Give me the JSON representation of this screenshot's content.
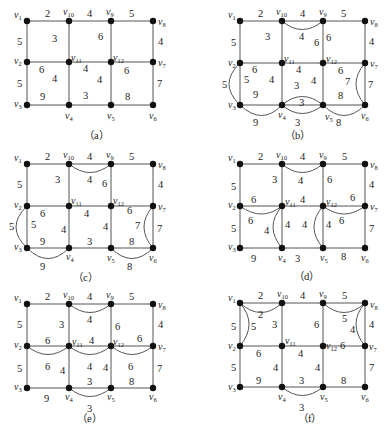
{
  "figure": {
    "vertices": [
      "v1",
      "v2",
      "v3",
      "v4",
      "v5",
      "v6",
      "v7",
      "v8",
      "v9",
      "v10",
      "v11",
      "v12"
    ],
    "grid_layout": {
      "top_row": [
        "v1",
        "v10",
        "v9",
        "v8"
      ],
      "middle_row": [
        "v2",
        "v11",
        "v12",
        "v7"
      ],
      "bottom_row": [
        "v3",
        "v4",
        "v5",
        "v6"
      ]
    },
    "base_edges": [
      {
        "u": "v1",
        "v": "v10",
        "w": 2
      },
      {
        "u": "v10",
        "v": "v9",
        "w": 4
      },
      {
        "u": "v9",
        "v": "v8",
        "w": 5
      },
      {
        "u": "v1",
        "v": "v2",
        "w": 5
      },
      {
        "u": "v10",
        "v": "v11",
        "w": 3
      },
      {
        "u": "v9",
        "v": "v12",
        "w": 6
      },
      {
        "u": "v8",
        "v": "v7",
        "w": 4
      },
      {
        "u": "v2",
        "v": "v11",
        "w": 6
      },
      {
        "u": "v11",
        "v": "v12",
        "w": 4
      },
      {
        "u": "v12",
        "v": "v7",
        "w": 6
      },
      {
        "u": "v2",
        "v": "v3",
        "w": 5
      },
      {
        "u": "v11",
        "v": "v4",
        "w": 4
      },
      {
        "u": "v12",
        "v": "v5",
        "w": 4
      },
      {
        "u": "v7",
        "v": "v6",
        "w": 7
      },
      {
        "u": "v3",
        "v": "v4",
        "w": 9
      },
      {
        "u": "v4",
        "v": "v5",
        "w": 3
      },
      {
        "u": "v5",
        "v": "v6",
        "w": 8
      }
    ],
    "panels": [
      {
        "id": "a",
        "caption": "（a）",
        "added_edges": []
      },
      {
        "id": "b",
        "caption": "（b）",
        "added_edges": [
          {
            "u": "v10",
            "v": "v9",
            "w": 4
          },
          {
            "u": "v9",
            "v": "v12",
            "w": 6
          },
          {
            "u": "v2",
            "v": "v3",
            "w": 5
          },
          {
            "u": "v3",
            "v": "v4",
            "w": 9
          },
          {
            "u": "v4",
            "v": "v5",
            "w": 3
          },
          {
            "u": "v4",
            "v": "v5",
            "w": 3,
            "note": "second duplicate above"
          },
          {
            "u": "v5",
            "v": "v6",
            "w": 8
          },
          {
            "u": "v7",
            "v": "v6",
            "w": 7
          }
        ]
      },
      {
        "id": "c",
        "caption": "（c）",
        "added_edges": [
          {
            "u": "v10",
            "v": "v9",
            "w": 4
          },
          {
            "u": "v2",
            "v": "v3",
            "w": 5
          },
          {
            "u": "v3",
            "v": "v4",
            "w": 9
          },
          {
            "u": "v5",
            "v": "v6",
            "w": 8
          },
          {
            "u": "v7",
            "v": "v6",
            "w": 7
          }
        ]
      },
      {
        "id": "d",
        "caption": "（d）",
        "added_edges": [
          {
            "u": "v10",
            "v": "v9",
            "w": 4
          },
          {
            "u": "v2",
            "v": "v11",
            "w": 6
          },
          {
            "u": "v11",
            "v": "v4",
            "w": 4
          },
          {
            "u": "v12",
            "v": "v5",
            "w": 4
          },
          {
            "u": "v12",
            "v": "v7",
            "w": 6
          }
        ]
      },
      {
        "id": "e",
        "caption": "（e）",
        "added_edges": [
          {
            "u": "v10",
            "v": "v9",
            "w": 4
          },
          {
            "u": "v2",
            "v": "v11",
            "w": 6
          },
          {
            "u": "v11",
            "v": "v12",
            "w": 4
          },
          {
            "u": "v12",
            "v": "v7",
            "w": 6
          },
          {
            "u": "v4",
            "v": "v5",
            "w": 3
          }
        ]
      },
      {
        "id": "f",
        "caption": "（f）",
        "added_edges": [
          {
            "u": "v1",
            "v": "v10",
            "w": 2
          },
          {
            "u": "v1",
            "v": "v2",
            "w": 5
          },
          {
            "u": "v9",
            "v": "v8",
            "w": 5
          },
          {
            "u": "v8",
            "v": "v7",
            "w": 4
          },
          {
            "u": "v4",
            "v": "v5",
            "w": 3
          }
        ]
      }
    ]
  },
  "panels": {
    "a": {
      "caption": "（a）",
      "labels": {
        "v1": "v",
        "v1s": "1",
        "v10": "v",
        "v10s": "10",
        "v9": "v",
        "v9s": "9",
        "v8": "v",
        "v8s": "8",
        "v2": "v",
        "v2s": "2",
        "v11": "v",
        "v11s": "11",
        "v12": "v",
        "v12s": "12",
        "v7": "v",
        "v7s": "7",
        "v3": "v",
        "v3s": "3",
        "v4": "v",
        "v4s": "4",
        "v5": "v",
        "v5s": "5",
        "v6": "v",
        "v6s": "6"
      },
      "weights": {
        "e_1_10": "2",
        "e_10_9": "4",
        "e_9_8": "5",
        "e_1_2": "5",
        "e_8_7": "4",
        "f_top_left": "3",
        "f_top_mid": "6",
        "e_2_11": "6",
        "e_11_12": "4",
        "e_12_7": "6",
        "e_2_3": "5",
        "f_bl": "4",
        "e_11_4": "9",
        "e_12_5": "4",
        "f_bm": "3",
        "f_br": "8",
        "e_7_6": "7"
      }
    },
    "b": {
      "caption": "（b）",
      "weights": {
        "e_1_10": "2",
        "e_10_9": "4",
        "e_9_8": "5",
        "e_1_2": "5",
        "e_10_11": "3",
        "d_10_9": "4",
        "e_9_12a": "6",
        "e_9_12b": "6",
        "e_8_7": "4",
        "e_2_11": "6",
        "e_11_12": "4",
        "e_12_7": "6",
        "d_2_3": "5",
        "e_2_3": "5",
        "e_11_4": "4",
        "w_mid3": "3",
        "e_12_5": "4",
        "e_7_6a": "7",
        "e_7_6b": "7",
        "e_3_4": "9",
        "d_4_5_top": "3",
        "e_5_6": "8",
        "d_3_4": "9",
        "d_4_5": "3",
        "d_5_6": "8"
      }
    },
    "c": {
      "caption": "（c）",
      "weights": {
        "e_1_10": "2",
        "e_10_9": "4",
        "e_9_8": "5",
        "e_1_2": "5",
        "e_10_11": "3",
        "d_10_9": "4",
        "e_9_12": "6",
        "e_8_7": "4",
        "e_2_11": "6",
        "e_11_12": "4",
        "e_12_7": "6",
        "d_2_3": "5",
        "e_2_3": "5",
        "e_11_4": "4",
        "e_12_5": "4",
        "d_7_6": "7",
        "e_7_6": "7",
        "e_3_4": "9",
        "e_4_5": "3",
        "e_5_6": "8",
        "d_3_4": "9",
        "d_5_6": "8"
      }
    },
    "d": {
      "caption": "（d）",
      "weights": {
        "e_1_10": "2",
        "e_10_9": "4",
        "e_9_8": "5",
        "e_1_2": "5",
        "e_10_11": "3",
        "d_10_9": "4",
        "e_9_12": "6",
        "e_8_7": "4",
        "e_2_11": "6",
        "e_11_12": "4",
        "e_12_7": "6",
        "d_2_11": "6",
        "d_12_7": "6",
        "e_2_3": "5",
        "d_11_4": "4",
        "e_11_4": "4",
        "w_mid": "4",
        "d_12_5": "4",
        "e_7_6": "7",
        "e_3_4": "9",
        "e_4_5": "3",
        "e_5_6": "8"
      }
    },
    "e": {
      "caption": "（e）",
      "weights": {
        "e_1_10": "2",
        "e_10_9": "4",
        "e_9_8": "5",
        "e_1_2": "5",
        "e_10_11": "3",
        "d_10_9": "4",
        "e_9_12": "6",
        "e_8_7": "4",
        "e_2_11": "6",
        "e_11_12": "4",
        "e_12_7": "6",
        "d_2_11": "6",
        "d_11_12": "4",
        "d_12_7": "6",
        "e_2_3": "5",
        "e_11_4": "4",
        "e_12_5": "4",
        "e_7_6": "7",
        "e_3_4": "9",
        "e_4_5": "3",
        "e_5_6": "8",
        "d_4_5": "3"
      }
    },
    "f": {
      "caption": "（f）",
      "weights": {
        "e_1_10": "2",
        "e_10_9": "4",
        "e_9_8": "5",
        "d_1_10": "2",
        "d_1_2": "5",
        "e_1_2": "5",
        "e_10_11": "3",
        "e_9_12": "6",
        "d_9_8": "5",
        "d_8_7": "4",
        "e_8_7": "4",
        "e_2_11": "6",
        "e_11_12": "4",
        "e_12_7": "6",
        "e_2_3": "5",
        "e_11_4": "4",
        "e_12_5": "4",
        "e_7_6": "7",
        "e_3_4": "9",
        "e_4_5": "3",
        "e_5_6": "8",
        "d_4_5": "3"
      }
    }
  },
  "colors": {
    "edge": "#555555",
    "node": "#111111",
    "text": "#222222",
    "background": "#ffffff"
  }
}
